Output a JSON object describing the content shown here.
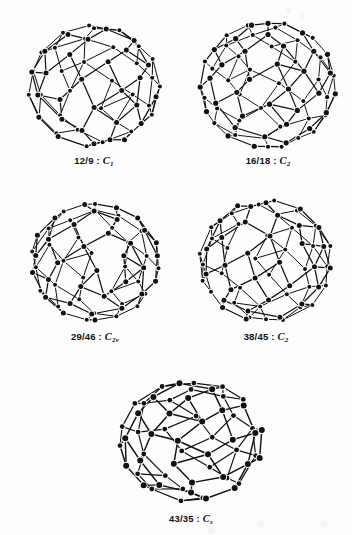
{
  "figure": {
    "background_color": "#fdfdfd",
    "ink_color": "#111111",
    "kind": "scanned-chemistry-figure"
  },
  "structures": [
    {
      "id": "isomer-12-9",
      "caption_numbers": "12/9 : ",
      "symmetry_letter": "C",
      "symmetry_sub": "1",
      "caption_full": "12/9 : C1",
      "position": {
        "left": 18,
        "top": 16,
        "width": 152,
        "height": 140
      },
      "cage": {
        "seed": 12009,
        "vertices": 60,
        "radius": 66,
        "tilt": -0.32,
        "yaw": 0.55,
        "squash": 0.92,
        "node_radius": 2.5,
        "line_width": 1.25
      }
    },
    {
      "id": "isomer-16-18",
      "caption_numbers": "16/18 : ",
      "symmetry_letter": "C",
      "symmetry_sub": "2",
      "caption_full": "16/18 : C2",
      "position": {
        "left": 192,
        "top": 14,
        "width": 152,
        "height": 142
      },
      "cage": {
        "seed": 16018,
        "vertices": 70,
        "radius": 68,
        "tilt": 0.22,
        "yaw": -0.75,
        "squash": 0.93,
        "node_radius": 2.6,
        "line_width": 1.2
      }
    },
    {
      "id": "isomer-29-46",
      "caption_numbers": "29/46 : ",
      "symmetry_letter": "C",
      "symmetry_sub": "2v",
      "caption_full": "29/46 : C2v",
      "position": {
        "left": 20,
        "top": 192,
        "width": 150,
        "height": 140
      },
      "cage": {
        "seed": 29046,
        "vertices": 64,
        "radius": 65,
        "tilt": -0.12,
        "yaw": 0.18,
        "squash": 0.9,
        "node_radius": 2.5,
        "line_width": 1.25
      }
    },
    {
      "id": "isomer-38-45",
      "caption_numbers": "38/45 : ",
      "symmetry_letter": "C",
      "symmetry_sub": "2",
      "caption_full": "38/45 : C2",
      "position": {
        "left": 190,
        "top": 190,
        "width": 152,
        "height": 142
      },
      "cage": {
        "seed": 38045,
        "vertices": 66,
        "radius": 67,
        "tilt": 0.3,
        "yaw": -0.3,
        "squash": 0.91,
        "node_radius": 2.5,
        "line_width": 1.25
      }
    },
    {
      "id": "isomer-43-35",
      "caption_numbers": "43/35 : ",
      "symmetry_letter": "C",
      "symmetry_sub": "s",
      "caption_full": "43/35 : Cs",
      "position": {
        "left": 108,
        "top": 368,
        "width": 166,
        "height": 146
      },
      "cage": {
        "seed": 43035,
        "vertices": 58,
        "radius": 72,
        "tilt": -0.55,
        "yaw": 0.95,
        "squash": 0.84,
        "node_radius": 3.0,
        "line_width": 1.45
      }
    }
  ]
}
